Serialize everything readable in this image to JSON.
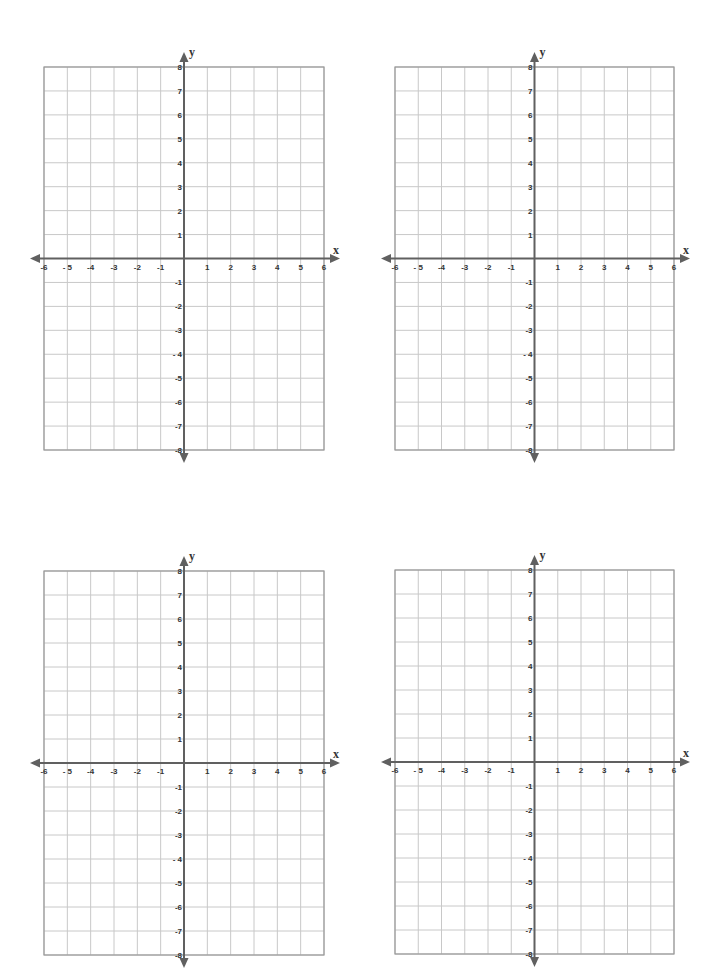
{
  "page": {
    "background": "#ffffff"
  },
  "style": {
    "grid_color": "#c8c8c8",
    "border_color": "#999999",
    "axis_color": "#606060",
    "label_color": "#333333"
  },
  "planes": [
    {
      "id": "top-left",
      "left": 44,
      "top": 67,
      "right": 324,
      "bottom": 450,
      "x_axis_label": "x",
      "y_axis_label": "y"
    },
    {
      "id": "top-right",
      "left": 395,
      "top": 67,
      "right": 674,
      "bottom": 450,
      "x_axis_label": "x",
      "y_axis_label": "y"
    },
    {
      "id": "bottom-left",
      "left": 44,
      "top": 571,
      "right": 324,
      "bottom": 955,
      "x_axis_label": "x",
      "y_axis_label": "y"
    },
    {
      "id": "bottom-right",
      "left": 395,
      "top": 570,
      "right": 674,
      "bottom": 954,
      "x_axis_label": "x",
      "y_axis_label": "y"
    }
  ],
  "chart_data": {
    "type": "coordinate-grid",
    "count": 4,
    "x_range": [
      -6,
      6
    ],
    "y_range": [
      -8,
      8
    ],
    "x_step": 1,
    "y_step": 1,
    "x_tick_labels": [
      "-6",
      "- 5",
      "-4",
      "-3",
      "-2",
      "-1",
      "1",
      "2",
      "3",
      "4",
      "5",
      "6"
    ],
    "y_tick_labels": [
      "8",
      "7",
      "6",
      "5",
      "4",
      "3",
      "2",
      "1",
      "-1",
      "-2",
      "-3",
      "- 4",
      "-5",
      "-6",
      "-7",
      "-8"
    ],
    "xlabel": "x",
    "ylabel": "y",
    "grid": true,
    "arrows": "both axes, both directions",
    "data_points": []
  }
}
